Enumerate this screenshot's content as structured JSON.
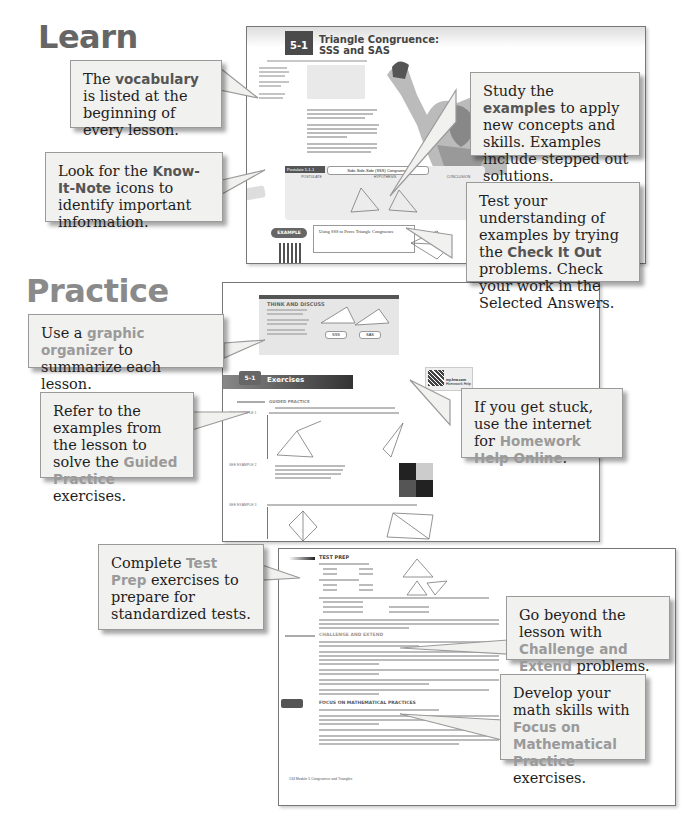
{
  "sections": {
    "learn": "Learn",
    "practice": "Practice"
  },
  "callouts": [
    {
      "id": "vocabulary",
      "pre": "The ",
      "highlight": "vocabulary",
      "post": " is listed at the beginning of every lesson."
    },
    {
      "id": "know-it-note",
      "pre": "Look for the ",
      "highlight": "Know-It-Note",
      "post": " icons to identify important information."
    },
    {
      "id": "examples",
      "pre": "Study the ",
      "highlight": "examples",
      "post": " to apply new concepts and skills. Examples include stepped out solutions."
    },
    {
      "id": "check-it-out",
      "pre": "Test your understanding of examples by trying the ",
      "highlight": "Check It Out",
      "post": " problems. Check your work in the Selected Answers."
    },
    {
      "id": "graphic-organizer",
      "pre": "Use a ",
      "highlight": "graphic organizer",
      "post": " to summarize each lesson."
    },
    {
      "id": "guided-practice",
      "pre": "Refer to the examples from the lesson to solve the ",
      "highlight": "Guided Practice",
      "post": " exercises."
    },
    {
      "id": "homework-help",
      "pre": "If you get stuck, use the internet for ",
      "highlight": "Homework Help Online",
      "post": "."
    },
    {
      "id": "test-prep",
      "pre": "Complete ",
      "highlight": "Test Prep",
      "post": " exercises to prepare for standardized tests."
    },
    {
      "id": "challenge-extend",
      "pre": "Go beyond the lesson with ",
      "highlight": "Challenge and Extend",
      "post": " problems."
    },
    {
      "id": "math-practices",
      "pre": "Develop your math skills with ",
      "highlight": "Focus on Mathematical Practice",
      "post": " exercises."
    }
  ],
  "page1": {
    "lesson_number": "5-1",
    "title_line1": "Triangle Congruence:",
    "title_line2": "SSS and SAS",
    "postulate_label": "Postulate 5-1-1",
    "postulate_name": "Side-Side-Side (SSS) Congruence",
    "postulate_cols": [
      "POSTULATE",
      "HYPOTHESIS",
      "CONCLUSION"
    ],
    "example_label": "EXAMPLE",
    "example_title": "Using SSS to Prove Triangle Congruence",
    "included_angle": "An included angle is an angle formed by two adjacent sides of a polygon."
  },
  "page2": {
    "think_discuss": "THINK AND DISCUSS",
    "organizer_boxes": [
      "SSS",
      "SAS"
    ],
    "exercises_number": "5-1",
    "exercises_title": "Exercises",
    "guided_practice": "GUIDED PRACTICE",
    "homework_site": "my.hrw.com",
    "homework_sub": "Homework Help",
    "see_example": [
      "SEE EXAMPLE 1",
      "SEE EXAMPLE 2",
      "SEE EXAMPLE 3"
    ]
  },
  "page3": {
    "test_prep": "TEST PREP",
    "challenge": "CHALLENGE AND EXTEND",
    "focus": "FOCUS ON MATHEMATICAL PRACTICES",
    "footer": "134  Module 5  Congruence and Triangles"
  }
}
